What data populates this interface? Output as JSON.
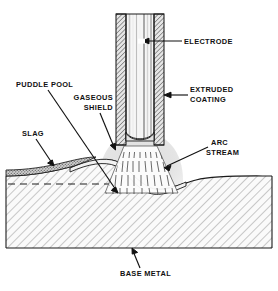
{
  "figure": {
    "background_color": "#ffffff",
    "ink_color": "#111111"
  },
  "labels": {
    "electrode": "ELECTRODE",
    "extruded_coating_line1": "EXTRUDED",
    "extruded_coating_line2": "COATING",
    "puddle_pool": "PUDDLE  POOL",
    "gaseous_shield_line1": "GASEOUS",
    "gaseous_shield_line2": "SHIELD",
    "slag": "SLAG",
    "arc_stream_line1": "ARC",
    "arc_stream_line2": "STREAM",
    "base_metal": "BASE  METAL"
  },
  "parts": {
    "electrode_core": {
      "name": "electrode core wire",
      "fill": "#f2f2f2"
    },
    "extruded_coating": {
      "name": "extruded flux coating",
      "fill": "#d8d8d8",
      "hatch": "cross"
    },
    "gaseous_shield": {
      "name": "gaseous shield cloud",
      "fill": "#e2e2e2"
    },
    "arc_stream": {
      "name": "arc stream",
      "fill": "#ffffff",
      "stroke": "#333333"
    },
    "slag": {
      "name": "slag layer",
      "fill": "#b5b5b5",
      "pattern": "stipple"
    },
    "weld_bead": {
      "name": "solidified weld bead",
      "fill": "#efefef"
    },
    "base_metal": {
      "name": "base metal plate",
      "fill": "#f7f7f7",
      "hatch": "diagonal-45"
    },
    "original_surface": {
      "name": "original plate surface",
      "style": "dashed"
    }
  },
  "colors": {
    "ink": "#111111",
    "hatch": "#9a9a9a",
    "shield": "#e2e2e2",
    "slag": "#b0b0b0"
  }
}
